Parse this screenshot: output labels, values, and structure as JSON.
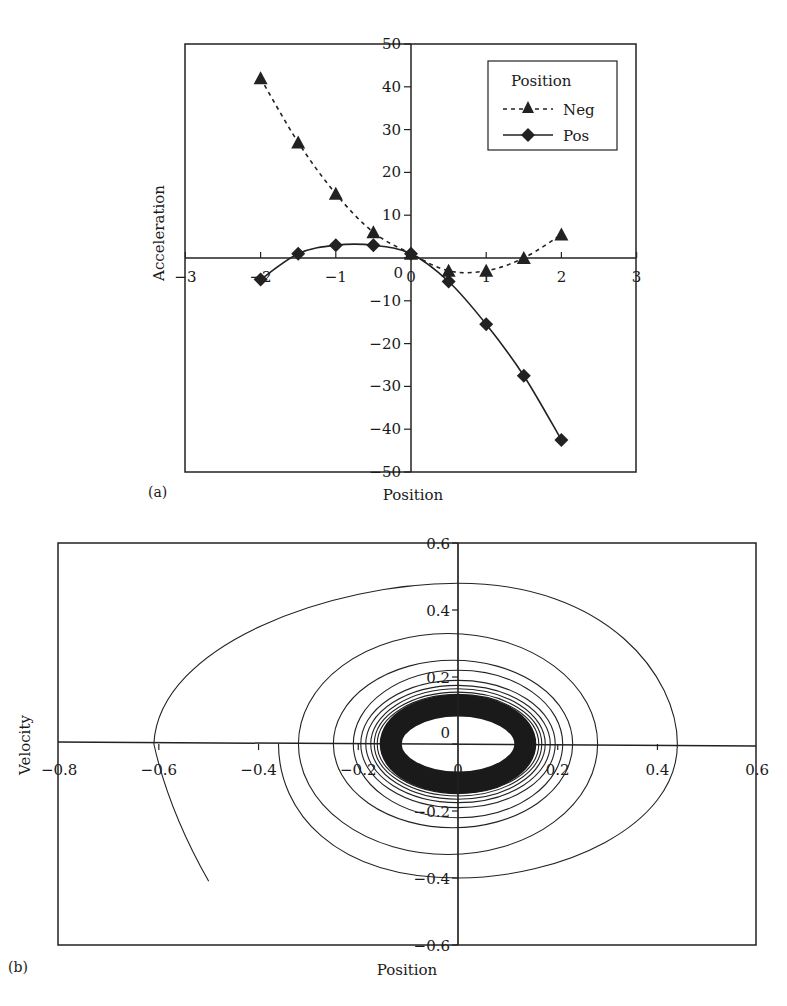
{
  "chart_data": [
    {
      "panel": "(a)",
      "type": "line",
      "title": "",
      "xlabel": "Position",
      "ylabel": "Acceleration",
      "xlim": [
        -3,
        3
      ],
      "ylim": [
        -50,
        50
      ],
      "x_ticks": [
        "-3",
        "-2",
        "-1",
        "0",
        "1",
        "2",
        "3"
      ],
      "y_ticks": [
        "50",
        "40",
        "30",
        "20",
        "10",
        "0",
        "-10",
        "-20",
        "-30",
        "-40",
        "-50"
      ],
      "grid": false,
      "legend": {
        "title": "Position",
        "position": "upper right",
        "entries": [
          "Neg",
          "Pos"
        ]
      },
      "x": [
        -2,
        -1.5,
        -1,
        -0.5,
        0,
        0.5,
        1,
        1.5,
        2
      ],
      "series": [
        {
          "name": "Neg",
          "marker": "triangle",
          "line": "dashed",
          "values": [
            42,
            27,
            15,
            6,
            1,
            -3,
            -3,
            0,
            5.5
          ]
        },
        {
          "name": "Pos",
          "marker": "diamond",
          "line": "solid",
          "values": [
            -5,
            1,
            3,
            3,
            1,
            -5.5,
            -15.5,
            -27.5,
            -42.5
          ]
        }
      ]
    },
    {
      "panel": "(b)",
      "type": "line",
      "title": "",
      "xlabel": "Position",
      "ylabel": "Velocity",
      "xlim": [
        -0.8,
        0.6
      ],
      "ylim": [
        -0.6,
        0.6
      ],
      "x_ticks": [
        "-0.8",
        "-0.6",
        "-0.4",
        "-0.2",
        "0",
        "0.2",
        "0.4",
        "0.6"
      ],
      "y_ticks": [
        "0.6",
        "0.4",
        "0.2",
        "0",
        "-0.2",
        "-0.4",
        "-0.6"
      ],
      "grid": false,
      "description": "Phase-plane spiral trajectory decaying inward to a dense limit cycle of radius ~0.15 in position and ~0.12 in velocity",
      "series": [
        {
          "name": "trajectory",
          "start": [
            -0.5,
            -0.41
          ],
          "outer_loop": {
            "x_min": -0.61,
            "x_max": 0.44,
            "v_max": 0.48,
            "v_min": -0.4
          },
          "limit_cycle": {
            "x_half_width": 0.15,
            "v_half_height": 0.12
          }
        }
      ]
    }
  ],
  "labels": {
    "a": {
      "panel": "(a)",
      "xlabel": "Position",
      "ylabel": "Acceleration",
      "legend_title": "Position",
      "legend_neg": "Neg",
      "legend_pos": "Pos",
      "xt": [
        "−3",
        "−2",
        "−1",
        "0",
        "1",
        "2",
        "3"
      ],
      "yt": [
        "50",
        "40",
        "30",
        "20",
        "10",
        "0",
        "−10",
        "−20",
        "−30",
        "−40",
        "−50"
      ]
    },
    "b": {
      "panel": "(b)",
      "xlabel": "Position",
      "ylabel": "Velocity",
      "xt": [
        "−0.8",
        "−0.6",
        "−0.4",
        "−0.2",
        "0",
        "0.2",
        "0.4",
        "0.6"
      ],
      "yt": [
        "0.6",
        "0.4",
        "0.2",
        "0",
        "−0.2",
        "−0.4",
        "−0.6"
      ]
    }
  }
}
